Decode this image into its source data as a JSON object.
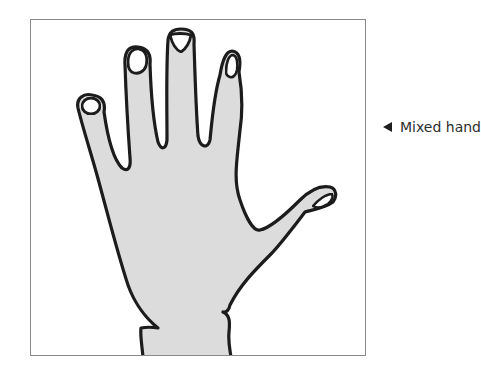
{
  "figure": {
    "caption": "Mixed hand",
    "caption_pointer_icon": "left-triangle-icon",
    "illustration": {
      "subject": "hand",
      "description": "Outline drawing of a left hand, palm facing viewer, four fingers raised and thumb extended to the right, fingernails visible",
      "colors": {
        "skin_fill": "#dcdcdc",
        "outline": "#1a1a1a",
        "nail_fill": "#ffffff",
        "frame_border": "#8a8a8a",
        "background": "#ffffff"
      }
    }
  }
}
